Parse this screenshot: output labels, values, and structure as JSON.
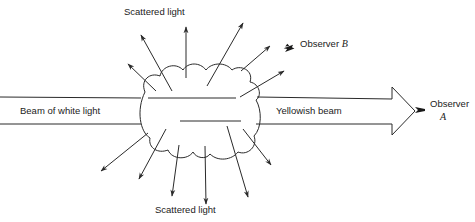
{
  "diagram": {
    "labels": {
      "incident_beam": "Beam of white light",
      "transmitted_beam": "Yellowish beam",
      "scattered_top": "Scattered light",
      "scattered_bottom": "Scattered light",
      "observer_b_word": "Observer",
      "observer_b_letter": "B",
      "observer_a_word": "Observer",
      "observer_a_letter": "A"
    },
    "icons": {
      "observer_b": "eye-icon",
      "observer_a": "eye-icon"
    },
    "colors": {
      "line": "#2a2a2a",
      "background": "#ffffff"
    }
  }
}
